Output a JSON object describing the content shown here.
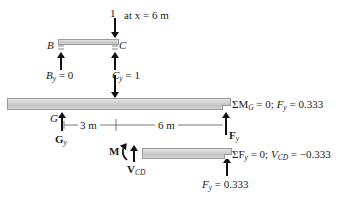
{
  "top_load": {
    "magnitude": "1",
    "position_text": "at x = 6 m"
  },
  "upper_beam": {
    "left_point": "B",
    "right_point": "C",
    "reaction_B": {
      "symbol": "B",
      "subscript": "y",
      "value_text": " = 0"
    },
    "reaction_C": {
      "symbol": "C",
      "subscript": "y",
      "value_text": " = 1"
    }
  },
  "main_beam": {
    "left_point": "G",
    "reaction_G": {
      "symbol": "G",
      "subscript": "y"
    },
    "reaction_F": {
      "symbol": "F",
      "subscript": "y"
    },
    "dimensions": [
      "3 m",
      "6 m"
    ],
    "equation": {
      "prefix": "ΣM",
      "sub": "G",
      "mid": " = 0; ",
      "var": "F",
      "var_sub": "y",
      "value": " = 0.333"
    }
  },
  "segment": {
    "moment_label": "M",
    "shear_label": {
      "symbol": "V",
      "subscript": "CD"
    },
    "force_label": {
      "symbol": "F",
      "subscript": "y",
      "value_text": " = 0.333"
    },
    "equation": {
      "prefix": "ΣF",
      "sub": "y",
      "mid": " = 0; ",
      "var": "V",
      "var_sub": "CD",
      "value": " = −0.333"
    }
  },
  "colors": {
    "beam_fill": "#d2d2d2",
    "beam_edge": "#9a9a9a",
    "arrow": "#111111"
  }
}
